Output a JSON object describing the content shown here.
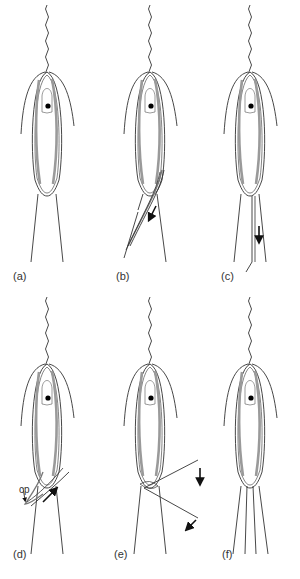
{
  "figure": {
    "panels": [
      {
        "id": "a",
        "label": "(a)",
        "cx": 47,
        "top": 0,
        "state": "at rest",
        "arrows": []
      },
      {
        "id": "b",
        "label": "(b)",
        "cx": 150,
        "top": 0,
        "state": "sliding along lorica",
        "arrows": [
          "down-left"
        ]
      },
      {
        "id": "c",
        "label": "(c)",
        "cx": 250,
        "top": 0,
        "state": "extruded down",
        "arrows": [
          "down"
        ]
      },
      {
        "id": "d",
        "label": "(d)",
        "cx": 47,
        "top": 292,
        "state": "cross pattern",
        "arrows": [
          "up-right"
        ],
        "annotation": "cp"
      },
      {
        "id": "e",
        "label": "(e)",
        "cx": 150,
        "top": 292,
        "state": "strands flared outward",
        "arrows": [
          "down",
          "down-left"
        ]
      },
      {
        "id": "f",
        "label": "(f)",
        "cx": 250,
        "top": 292,
        "state": "multiple strands below",
        "arrows": []
      }
    ],
    "colors": {
      "outline": "#333333",
      "band": "#9a9a9a",
      "nucleus": "#000000",
      "background": "#ffffff"
    }
  }
}
